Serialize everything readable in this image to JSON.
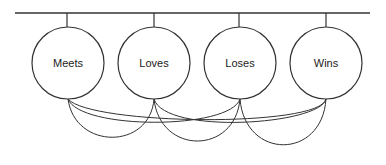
{
  "diagram": {
    "type": "network",
    "bus": {
      "x1": 15,
      "x2": 370,
      "y": 13
    },
    "nodes": [
      {
        "id": "meets",
        "label": "Meets",
        "cx": 68,
        "cy": 63,
        "r": 36
      },
      {
        "id": "loves",
        "label": "Loves",
        "cx": 154,
        "cy": 63,
        "r": 36
      },
      {
        "id": "loses",
        "label": "Loses",
        "cx": 240,
        "cy": 63,
        "r": 36
      },
      {
        "id": "wins",
        "label": "Wins",
        "cx": 326,
        "cy": 63,
        "r": 36
      }
    ],
    "edges": [
      {
        "from": "Meets",
        "to": "Loves"
      },
      {
        "from": "Meets",
        "to": "Loses"
      },
      {
        "from": "Meets",
        "to": "Wins"
      },
      {
        "from": "Loves",
        "to": "Loses"
      },
      {
        "from": "Loves",
        "to": "Wins"
      },
      {
        "from": "Loses",
        "to": "Wins"
      }
    ],
    "stroke_color": "#333333"
  }
}
